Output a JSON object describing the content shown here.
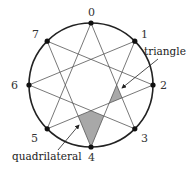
{
  "diagram": {
    "type": "star polygon {8/3} inscribed in circle",
    "circle": {
      "cx": 91,
      "cy": 85,
      "r": 62
    },
    "vertices": [
      {
        "label": "0",
        "x": 91,
        "y": 23
      },
      {
        "label": "1",
        "x": 134.8,
        "y": 41.2
      },
      {
        "label": "2",
        "x": 153,
        "y": 85
      },
      {
        "label": "3",
        "x": 134.8,
        "y": 128.8
      },
      {
        "label": "4",
        "x": 91,
        "y": 147
      },
      {
        "label": "5",
        "x": 47.2,
        "y": 128.8
      },
      {
        "label": "6",
        "x": 29,
        "y": 85
      },
      {
        "label": "7",
        "x": 47.2,
        "y": 41.2
      }
    ],
    "edges": [
      [
        0,
        3
      ],
      [
        3,
        6
      ],
      [
        6,
        1
      ],
      [
        1,
        4
      ],
      [
        4,
        7
      ],
      [
        7,
        2
      ],
      [
        2,
        5
      ],
      [
        5,
        0
      ]
    ],
    "shaded_regions": [
      {
        "name": "triangle",
        "points": "116.7,85 122,97.9 109.2,103.1"
      },
      {
        "name": "quadrilateral",
        "points": "91,147 103.8,116 91,110.7 78.2,116"
      }
    ],
    "annotations": {
      "triangle_label": "triangle",
      "quadrilateral_label": "quadrilateral"
    },
    "colors": {
      "stroke": "#555555",
      "circle": "#222222",
      "fill": "#a8a8a8",
      "dot": "#111111"
    }
  }
}
